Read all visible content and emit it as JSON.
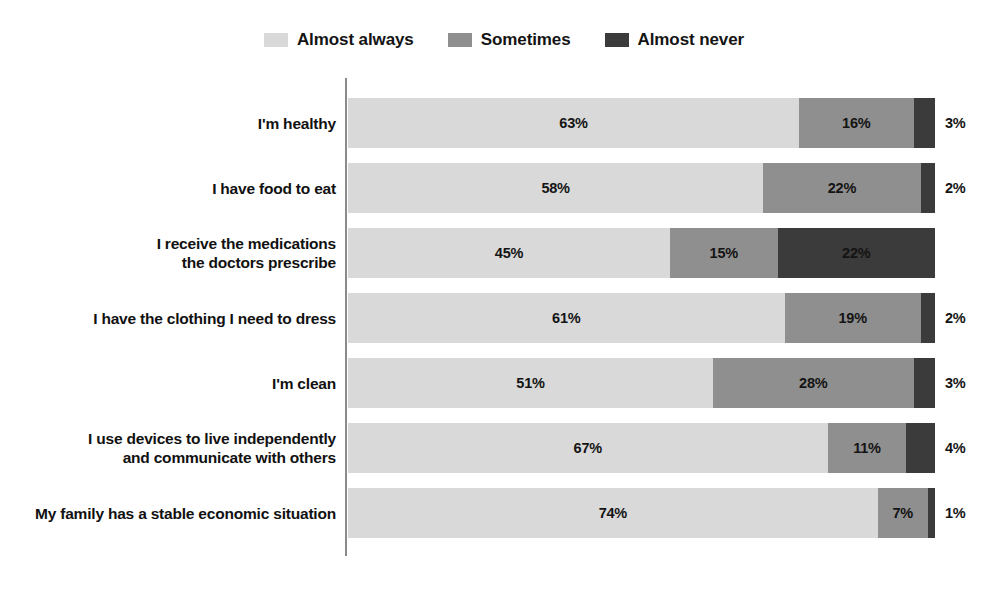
{
  "legend": {
    "items": [
      {
        "label": "Almost always",
        "key": "almost_always",
        "color": "#d9d9d9",
        "swatch_name": "legend-swatch-almost-always"
      },
      {
        "label": "Sometimes",
        "key": "sometimes",
        "color": "#8f8f8f",
        "swatch_name": "legend-swatch-sometimes"
      },
      {
        "label": "Almost never",
        "key": "almost_never",
        "color": "#3b3b3b",
        "swatch_name": "legend-swatch-almost-never"
      }
    ]
  },
  "chart_data": {
    "type": "bar",
    "subtype": "stacked-horizontal",
    "title": "",
    "xlabel": "",
    "ylabel": "",
    "grid": false,
    "legend_position": "top-center",
    "axis": {
      "show_y_axis_line": true,
      "show_x_axis_line": false,
      "x_scale_max_percent": 82
    },
    "categories": [
      "I'm healthy",
      "I have food to eat",
      "I receive the medications the doctors prescribe",
      "I have the clothing I need to dress",
      "I'm clean",
      "I use devices to live independently and communicate with others",
      "My family has a stable economic situation"
    ],
    "series": [
      {
        "name": "Almost always",
        "color": "#d9d9d9",
        "values": [
          63,
          58,
          45,
          61,
          51,
          67,
          74
        ]
      },
      {
        "name": "Sometimes",
        "color": "#8f8f8f",
        "values": [
          16,
          22,
          15,
          19,
          28,
          11,
          7
        ]
      },
      {
        "name": "Almost never",
        "color": "#3b3b3b",
        "values": [
          3,
          2,
          22,
          2,
          3,
          4,
          1
        ]
      }
    ]
  },
  "rows": [
    {
      "label_lines": [
        "I'm healthy"
      ],
      "name": "row-im-healthy",
      "segments": [
        {
          "key": "almost_always",
          "value": 63,
          "value_label": "63%",
          "inside": true
        },
        {
          "key": "sometimes",
          "value": 16,
          "value_label": "16%",
          "inside": true
        },
        {
          "key": "almost_never",
          "value": 3,
          "value_label": "3%",
          "inside": false
        }
      ]
    },
    {
      "label_lines": [
        "I have food to eat"
      ],
      "name": "row-i-have-food-to-eat",
      "segments": [
        {
          "key": "almost_always",
          "value": 58,
          "value_label": "58%",
          "inside": true
        },
        {
          "key": "sometimes",
          "value": 22,
          "value_label": "22%",
          "inside": true
        },
        {
          "key": "almost_never",
          "value": 2,
          "value_label": "2%",
          "inside": false
        }
      ]
    },
    {
      "label_lines": [
        "I receive the medications",
        "the doctors prescribe"
      ],
      "name": "row-i-receive-the-medications",
      "segments": [
        {
          "key": "almost_always",
          "value": 45,
          "value_label": "45%",
          "inside": true
        },
        {
          "key": "sometimes",
          "value": 15,
          "value_label": "15%",
          "inside": true
        },
        {
          "key": "almost_never",
          "value": 22,
          "value_label": "22%",
          "inside": true
        }
      ]
    },
    {
      "label_lines": [
        "I have the clothing I need to dress"
      ],
      "name": "row-i-have-the-clothing",
      "segments": [
        {
          "key": "almost_always",
          "value": 61,
          "value_label": "61%",
          "inside": true
        },
        {
          "key": "sometimes",
          "value": 19,
          "value_label": "19%",
          "inside": true
        },
        {
          "key": "almost_never",
          "value": 2,
          "value_label": "2%",
          "inside": false
        }
      ]
    },
    {
      "label_lines": [
        "I'm clean"
      ],
      "name": "row-im-clean",
      "segments": [
        {
          "key": "almost_always",
          "value": 51,
          "value_label": "51%",
          "inside": true
        },
        {
          "key": "sometimes",
          "value": 28,
          "value_label": "28%",
          "inside": true
        },
        {
          "key": "almost_never",
          "value": 3,
          "value_label": "3%",
          "inside": false
        }
      ]
    },
    {
      "label_lines": [
        "I use devices to live independently",
        "and communicate with others"
      ],
      "name": "row-i-use-devices",
      "segments": [
        {
          "key": "almost_always",
          "value": 67,
          "value_label": "67%",
          "inside": true
        },
        {
          "key": "sometimes",
          "value": 11,
          "value_label": "11%",
          "inside": true
        },
        {
          "key": "almost_never",
          "value": 4,
          "value_label": "4%",
          "inside": false
        }
      ]
    },
    {
      "label_lines": [
        "My family has a stable economic situation"
      ],
      "name": "row-my-family-has-a-stable-economic-situation",
      "segments": [
        {
          "key": "almost_always",
          "value": 74,
          "value_label": "74%",
          "inside": true
        },
        {
          "key": "sometimes",
          "value": 7,
          "value_label": "7%",
          "inside": true
        },
        {
          "key": "almost_never",
          "value": 1,
          "value_label": "1%",
          "inside": false
        }
      ]
    }
  ],
  "layout": {
    "bar_left_px": 348,
    "bar_width_px": 587,
    "row_height_px": 50,
    "row_pitch_px": 65,
    "first_row_top_px": 20,
    "scale_max_percent": 82
  }
}
